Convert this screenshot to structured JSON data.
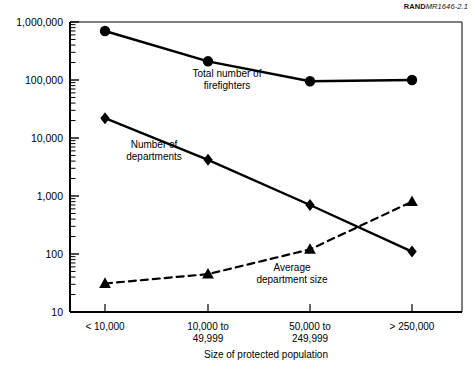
{
  "figure": {
    "source_note_brand": "RAND",
    "source_note_id": "MR1646-2.1"
  },
  "chart_data": {
    "type": "line",
    "title": "",
    "xlabel": "Size of protected population",
    "ylabel": "",
    "yscale": "log",
    "ylim": [
      10,
      1000000
    ],
    "grid": false,
    "legend": "inline-annotations",
    "categories": [
      "< 10,000",
      "10,000 to 49,999",
      "50,000 to 249,999",
      "> 250,000"
    ],
    "category_lines": [
      [
        "< 10,000",
        ""
      ],
      [
        "10,000 to",
        "49,999"
      ],
      [
        "50,000 to",
        "249,999"
      ],
      [
        "> 250,000",
        ""
      ]
    ],
    "ytick_labels": [
      "1,000,000",
      "100,000",
      "10,000",
      "1,000",
      "100",
      "10"
    ],
    "ytick_values": [
      1000000,
      100000,
      10000,
      1000,
      100,
      10
    ],
    "series": [
      {
        "name": "Total number of firefighters",
        "marker": "circle",
        "linestyle": "solid",
        "color": "#000000",
        "values": [
          700000,
          210000,
          95000,
          100000
        ],
        "label_lines": [
          "Total number of",
          "firefighters"
        ]
      },
      {
        "name": "Number of departments",
        "marker": "diamond",
        "linestyle": "solid",
        "color": "#000000",
        "values": [
          22000,
          4200,
          700,
          110
        ],
        "label_lines": [
          "Number of",
          "departments"
        ]
      },
      {
        "name": "Average department size",
        "marker": "triangle",
        "linestyle": "dashed",
        "color": "#000000",
        "values": [
          31,
          45,
          120,
          800
        ],
        "label_lines": [
          "Average",
          "department size"
        ]
      }
    ]
  }
}
